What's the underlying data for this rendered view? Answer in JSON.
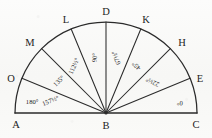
{
  "figure": {
    "type": "geometry-diagram",
    "background_color": "#fbfbfa",
    "ink_color": "#2b2b2b",
    "center_point": "B",
    "baseline_endpoints": [
      "A",
      "C"
    ],
    "radius_px": 91
  },
  "points": [
    {
      "label": "A",
      "angle_deg": 180,
      "role": "baseline-left-end",
      "x": 16,
      "y": 126
    },
    {
      "label": "B",
      "angle_deg": null,
      "role": "center-vertex",
      "x": 106,
      "y": 127
    },
    {
      "label": "C",
      "angle_deg": 0,
      "role": "baseline-right-end",
      "x": 196,
      "y": 126
    },
    {
      "label": "O",
      "angle_deg": 157.5,
      "role": "arc-point",
      "x": 11,
      "y": 80
    },
    {
      "label": "M",
      "angle_deg": 135,
      "role": "arc-point",
      "x": 30,
      "y": 44
    },
    {
      "label": "L",
      "angle_deg": 112.5,
      "role": "arc-point",
      "x": 66,
      "y": 21
    },
    {
      "label": "D",
      "angle_deg": 90,
      "role": "arc-point-apex",
      "x": 106,
      "y": 13
    },
    {
      "label": "K",
      "angle_deg": 67.5,
      "role": "arc-point",
      "x": 146,
      "y": 21
    },
    {
      "label": "H",
      "angle_deg": 45,
      "role": "arc-point",
      "x": 182,
      "y": 44
    },
    {
      "label": "E",
      "angle_deg": 22.5,
      "role": "arc-point",
      "x": 200,
      "y": 80
    }
  ],
  "rays": [
    {
      "to": "O",
      "angle_deg": 157.5
    },
    {
      "to": "M",
      "angle_deg": 135
    },
    {
      "to": "L",
      "angle_deg": 112.5
    },
    {
      "to": "D",
      "angle_deg": 90
    },
    {
      "to": "K",
      "angle_deg": 67.5
    },
    {
      "to": "H",
      "angle_deg": 45
    },
    {
      "to": "E",
      "angle_deg": 22.5
    }
  ],
  "angle_labels": [
    {
      "text": "180°",
      "angle_deg": 180,
      "place_at_deg": 172,
      "radius_frac": 0.82,
      "rotate": 0
    },
    {
      "text": "157½°",
      "angle_deg": 157.5,
      "place_at_deg": 168,
      "radius_frac": 0.62,
      "rotate": -22
    },
    {
      "text": "135°",
      "angle_deg": 135,
      "place_at_deg": 146,
      "radius_frac": 0.62,
      "rotate": -44
    },
    {
      "text": "112½°",
      "angle_deg": 112.5,
      "place_at_deg": 124,
      "radius_frac": 0.62,
      "rotate": -66
    },
    {
      "text": "90°",
      "angle_deg": 90,
      "place_at_deg": 101,
      "radius_frac": 0.62,
      "rotate": -88
    },
    {
      "text": "67½°",
      "angle_deg": 67.5,
      "place_at_deg": 79,
      "radius_frac": 0.62,
      "rotate": -111
    },
    {
      "text": "45°",
      "angle_deg": 45,
      "place_at_deg": 57,
      "radius_frac": 0.62,
      "rotate": -133
    },
    {
      "text": "22½°",
      "angle_deg": 22.5,
      "place_at_deg": 34,
      "radius_frac": 0.62,
      "rotate": -155
    },
    {
      "text": "0°",
      "angle_deg": 0,
      "place_at_deg": 8,
      "radius_frac": 0.82,
      "rotate": -175
    }
  ]
}
